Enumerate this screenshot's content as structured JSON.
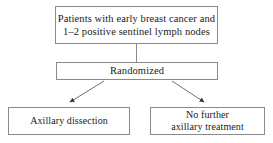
{
  "diagram": {
    "type": "clinical-trial-flowchart",
    "line_color": "#8a8a8a",
    "text_color": "#1a1a1a",
    "background_color": "#ffffff",
    "nodes": [
      {
        "id": "population",
        "label": "Patients with early breast cancer and\n1–2 positive sentinel lymph nodes"
      },
      {
        "id": "randomized",
        "label": "Randomized"
      },
      {
        "id": "axillary_dissection",
        "label": "Axillary dissection"
      },
      {
        "id": "no_further_treatment",
        "label": "No further\naxillary treatment"
      }
    ],
    "edges": [
      {
        "id": "population-to-randomized",
        "from": "population",
        "to": "randomized",
        "style": "straight",
        "arrowhead": false
      },
      {
        "id": "randomized-to-axillary-dissection",
        "from": "randomized",
        "to": "axillary_dissection",
        "style": "diagonal",
        "arrowhead": true
      },
      {
        "id": "randomized-to-no-further-treatment",
        "from": "randomized",
        "to": "no_further_treatment",
        "style": "diagonal",
        "arrowhead": true
      }
    ]
  }
}
